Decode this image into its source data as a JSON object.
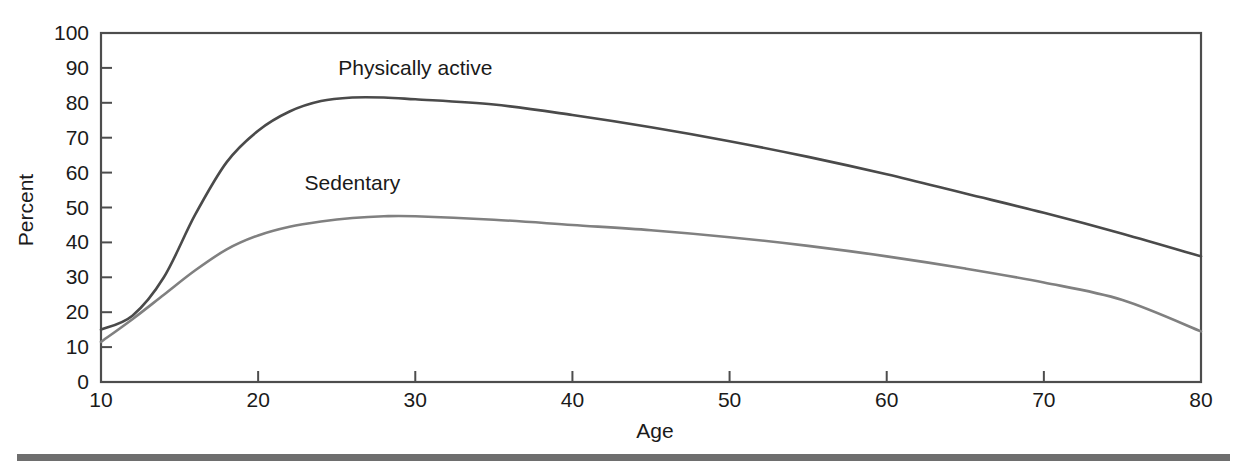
{
  "chart_data": {
    "type": "line",
    "title": "",
    "xlabel": "Age",
    "ylabel": "Percent",
    "xlim": [
      10,
      80
    ],
    "ylim": [
      0,
      100
    ],
    "grid": false,
    "legend_position": "inline-annotations",
    "xticks": [
      "10",
      "20",
      "30",
      "40",
      "50",
      "60",
      "70",
      "80"
    ],
    "xtick_values": [
      10,
      20,
      30,
      40,
      50,
      60,
      70,
      80
    ],
    "yticks": [
      "0",
      "10",
      "20",
      "30",
      "40",
      "50",
      "60",
      "70",
      "80",
      "90",
      "100"
    ],
    "ytick_values": [
      0,
      10,
      20,
      30,
      40,
      50,
      60,
      70,
      80,
      90,
      100
    ],
    "x": [
      10,
      12,
      14,
      16,
      18,
      20,
      22,
      24,
      26,
      28,
      30,
      35,
      40,
      45,
      50,
      55,
      60,
      65,
      70,
      75,
      80
    ],
    "series": [
      {
        "name": "Physically active",
        "color": "#4a4a4a",
        "label_x": 30,
        "label_y": 88,
        "values": [
          15,
          19,
          30,
          48,
          63,
          72,
          77.5,
          80.5,
          81.5,
          81.5,
          81,
          79.5,
          76.5,
          73,
          69,
          64.5,
          59.5,
          54,
          48.5,
          42.5,
          36
        ]
      },
      {
        "name": "Sedentary",
        "color": "#808080",
        "label_x": 26,
        "label_y": 55,
        "values": [
          11.5,
          18,
          25,
          32,
          38,
          42,
          44.5,
          46,
          47,
          47.5,
          47.5,
          46.5,
          45,
          43.5,
          41.5,
          39,
          36,
          32.5,
          28.5,
          23.5,
          14.5
        ]
      }
    ]
  },
  "footer": {
    "rule": "horizontal-rule"
  }
}
